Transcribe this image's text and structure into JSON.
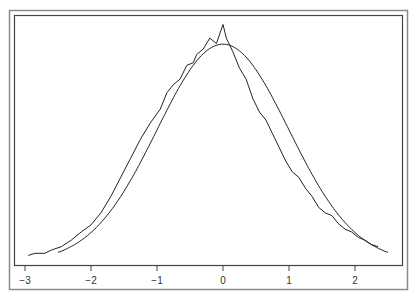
{
  "chart_data": {
    "type": "line",
    "title": "",
    "xlabel": "",
    "ylabel": "",
    "xlim": [
      -3.1,
      2.7
    ],
    "x_ticks": [
      -3,
      -2,
      -1,
      0,
      1,
      2
    ],
    "x_tick_labels": [
      "−3",
      "−2",
      "−1",
      "0",
      "1",
      "2"
    ],
    "y_ticks": [],
    "grid": false,
    "legend": null,
    "series": [
      {
        "name": "normal density (smooth)",
        "style": "smooth",
        "x": [
          -2.5,
          -2.25,
          -2,
          -1.75,
          -1.5,
          -1.25,
          -1,
          -0.75,
          -0.5,
          -0.25,
          0,
          0.25,
          0.5,
          0.75,
          1,
          1.25,
          1.5,
          1.75,
          2,
          2.25,
          2.5
        ],
        "y": [
          0.0175,
          0.0317,
          0.054,
          0.0863,
          0.1295,
          0.1826,
          0.242,
          0.3011,
          0.3521,
          0.3867,
          0.3989,
          0.3867,
          0.3521,
          0.3011,
          0.242,
          0.1826,
          0.1295,
          0.0863,
          0.054,
          0.0317,
          0.0175
        ]
      },
      {
        "name": "empirical density (jagged)",
        "style": "jagged",
        "x": [
          -2.95,
          -2.85,
          -2.7,
          -2.6,
          -2.45,
          -2.3,
          -2.15,
          -2.0,
          -1.85,
          -1.7,
          -1.55,
          -1.4,
          -1.25,
          -1.1,
          -0.95,
          -0.85,
          -0.75,
          -0.65,
          -0.55,
          -0.45,
          -0.4,
          -0.3,
          -0.2,
          -0.1,
          0.0,
          0.05,
          0.15,
          0.25,
          0.35,
          0.45,
          0.55,
          0.65,
          0.75,
          0.85,
          0.95,
          1.05,
          1.15,
          1.25,
          1.35,
          1.45,
          1.55,
          1.65,
          1.75,
          1.85,
          1.95,
          2.05,
          2.15,
          2.25,
          2.35
        ],
        "y": [
          0.012,
          0.016,
          0.016,
          0.022,
          0.028,
          0.04,
          0.055,
          0.068,
          0.09,
          0.12,
          0.155,
          0.19,
          0.225,
          0.255,
          0.28,
          0.31,
          0.325,
          0.335,
          0.36,
          0.365,
          0.38,
          0.39,
          0.41,
          0.4,
          0.435,
          0.41,
          0.385,
          0.355,
          0.335,
          0.3,
          0.275,
          0.26,
          0.235,
          0.21,
          0.185,
          0.165,
          0.155,
          0.135,
          0.12,
          0.1,
          0.09,
          0.085,
          0.07,
          0.06,
          0.055,
          0.045,
          0.04,
          0.032,
          0.028
        ]
      }
    ],
    "axis": {
      "px_per_unit_x": 66,
      "x_zero_px": 223,
      "y_baseline_px": 262,
      "px_per_unit_y": 546
    }
  }
}
